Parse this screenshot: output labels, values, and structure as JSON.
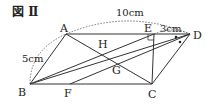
{
  "figure": {
    "title": "図 Ⅱ",
    "points": {
      "A": "A",
      "B": "B",
      "C": "C",
      "D": "D",
      "E": "E",
      "F": "F",
      "G": "G",
      "H": "H"
    },
    "measurements": {
      "AD": "10cm",
      "AB": "5cm",
      "ED": "3cm"
    },
    "colors": {
      "line": "#333333",
      "background": "#ffffff"
    }
  }
}
